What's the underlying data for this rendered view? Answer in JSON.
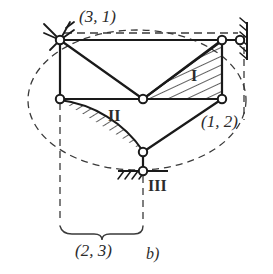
{
  "figure": {
    "caption": "b)",
    "kind": "kinematic-chain-diagram",
    "line_color": "#1a1a1a",
    "dash_color": "#3a3a3a",
    "joint_fill": "#ffffff",
    "labels": {
      "top_left_pair": "(3, 1)",
      "right_pair": "(1, 2)",
      "bottom_pair": "(2, 3)",
      "region_one": "I",
      "region_two": "II",
      "region_three": "III"
    },
    "joints": [
      {
        "id": "A",
        "name": "joint-top-left",
        "x": 60,
        "y": 40
      },
      {
        "id": "B",
        "name": "joint-top-right",
        "x": 222,
        "y": 40
      },
      {
        "id": "W",
        "name": "joint-wall-right",
        "x": 240,
        "y": 40
      },
      {
        "id": "C",
        "name": "joint-mid-left",
        "x": 60,
        "y": 99
      },
      {
        "id": "D",
        "name": "joint-mid-center",
        "x": 143,
        "y": 99
      },
      {
        "id": "E",
        "name": "joint-mid-right",
        "x": 222,
        "y": 99
      },
      {
        "id": "F",
        "name": "joint-bottom",
        "x": 143,
        "y": 152
      },
      {
        "id": "G",
        "name": "joint-ground",
        "x": 143,
        "y": 171
      }
    ],
    "members": [
      {
        "name": "member-top-chord",
        "from": "A",
        "to": "B"
      },
      {
        "name": "member-left-post",
        "from": "A",
        "to": "C"
      },
      {
        "name": "member-diagonal-left",
        "from": "A",
        "to": "D"
      },
      {
        "name": "member-mid-chord",
        "from": "C",
        "to": "E"
      },
      {
        "name": "member-diagonal-right",
        "from": "D",
        "to": "B"
      },
      {
        "name": "member-right-post",
        "from": "B",
        "to": "E"
      },
      {
        "name": "member-diagonal-bottom",
        "from": "E",
        "to": "F"
      },
      {
        "name": "member-ground-link",
        "from": "F",
        "to": "G"
      },
      {
        "name": "member-wall-link",
        "from": "B",
        "to": "W"
      }
    ],
    "supports": [
      {
        "name": "support-top-left",
        "type": "hatched-pin"
      },
      {
        "name": "support-right",
        "type": "hatched-wall"
      },
      {
        "name": "support-bottom",
        "type": "hatched-ground"
      }
    ],
    "hatched_regions": [
      {
        "name": "region-I-triangle",
        "label": "I"
      },
      {
        "name": "region-II-crescent",
        "label": "II"
      }
    ],
    "dashed_elements": [
      {
        "name": "dashed-ellipse"
      },
      {
        "name": "dashed-top-line"
      },
      {
        "name": "dashed-left-extension"
      },
      {
        "name": "dashed-right-extension"
      },
      {
        "name": "dashed-center-extension"
      }
    ],
    "dimension": {
      "name": "dimension-brace-bottom",
      "label": "(2, 3)"
    }
  }
}
